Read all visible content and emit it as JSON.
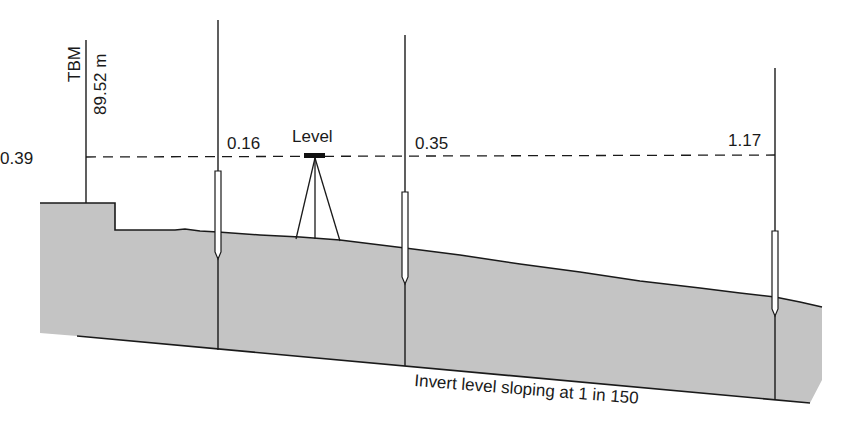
{
  "diagram": {
    "benchmark": {
      "label": "TBM",
      "elevation": "89.52 m",
      "staff_reading": "0.39"
    },
    "instrument": {
      "label": "Level"
    },
    "staves": [
      {
        "reading": "0.16"
      },
      {
        "reading": "0.35"
      },
      {
        "reading": "1.17"
      }
    ],
    "invert_caption": "Invert level sloping at 1 in 150"
  },
  "colors": {
    "ground_fill": "#c4c4c4",
    "line": "#1a1a1a",
    "background": "#ffffff"
  }
}
